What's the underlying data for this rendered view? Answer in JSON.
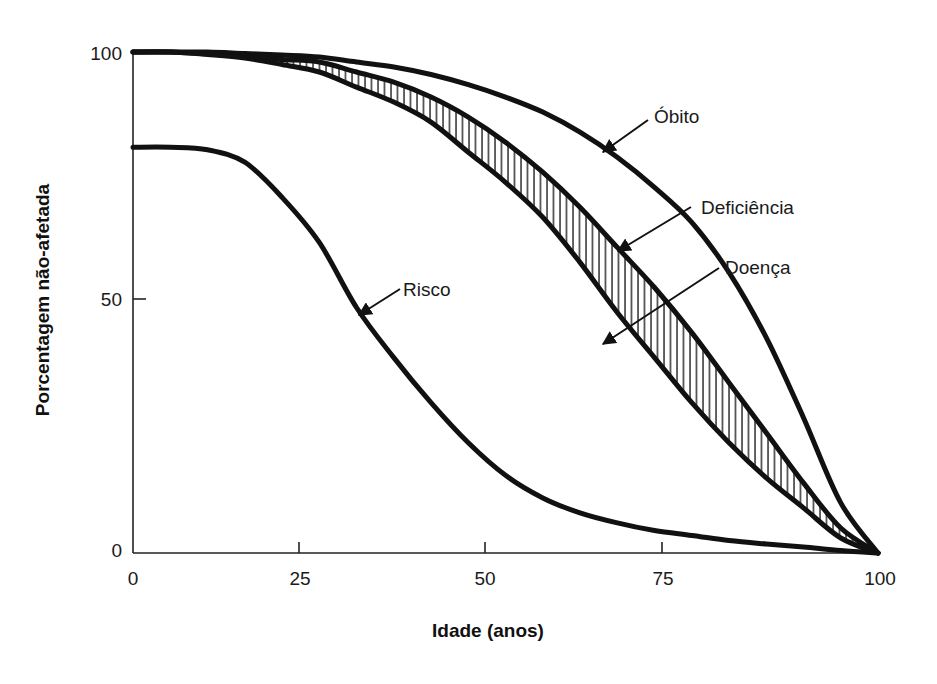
{
  "chart_data": {
    "type": "line",
    "title": "",
    "xlabel": "Idade (anos)",
    "ylabel": "Porcentagem não-afetada",
    "xlim": [
      0,
      100
    ],
    "ylim": [
      0,
      100
    ],
    "x_ticks": [
      0,
      25,
      50,
      75,
      100
    ],
    "y_ticks": [
      0,
      50,
      100
    ],
    "grid": false,
    "legend": "none (curves labeled directly with arrows)",
    "x": [
      0,
      5,
      10,
      15,
      20,
      25,
      30,
      35,
      40,
      45,
      50,
      55,
      60,
      65,
      70,
      75,
      80,
      85,
      90,
      95,
      100
    ],
    "series": [
      {
        "name": "Óbito",
        "values": [
          100,
          100,
          100,
          99.7,
          99.4,
          99,
          98,
          97,
          95.5,
          93.5,
          91,
          88,
          84,
          79,
          73,
          66,
          56,
          43,
          27,
          10,
          0
        ]
      },
      {
        "name": "Deficiência",
        "values": [
          100,
          100,
          99.6,
          99.1,
          98.5,
          98,
          96,
          94,
          91,
          87,
          82,
          76,
          69,
          61,
          53,
          44,
          34,
          24,
          14,
          5,
          0
        ]
      },
      {
        "name": "Doença",
        "values": [
          100,
          100,
          99.5,
          98.8,
          97.5,
          96,
          93,
          90,
          86,
          80,
          74,
          67,
          58,
          48,
          39,
          30,
          22,
          15,
          9,
          3,
          0
        ]
      },
      {
        "name": "Risco",
        "values": [
          81,
          81,
          80.5,
          78,
          71,
          62,
          49,
          39,
          30,
          22,
          15.5,
          11,
          8,
          6,
          4.5,
          3.5,
          2.5,
          1.8,
          1.2,
          0.5,
          0
        ]
      }
    ],
    "shaded_region": {
      "between": [
        "Deficiência",
        "Doença"
      ],
      "pattern": "vertical hatching"
    },
    "annotations": [
      {
        "text": "Óbito",
        "arrow_to": [
          65,
          80
        ]
      },
      {
        "text": "Deficiência",
        "arrow_to": [
          65,
          60
        ]
      },
      {
        "text": "Doença",
        "arrow_to": [
          63,
          41
        ]
      },
      {
        "text": "Risco",
        "arrow_to": [
          30,
          47
        ]
      }
    ]
  },
  "axes": {
    "xlabel": "Idade (anos)",
    "ylabel": "Porcentagem não-afetada",
    "x_tick_labels": [
      "0",
      "25",
      "50",
      "75",
      "100"
    ],
    "y_tick_labels": [
      "0",
      "50",
      "100"
    ]
  },
  "labels": {
    "obito": "Óbito",
    "deficiencia": "Deficiência",
    "doenca": "Doença",
    "risco": "Risco"
  },
  "colors": {
    "ink": "#111111",
    "background": "#ffffff"
  }
}
